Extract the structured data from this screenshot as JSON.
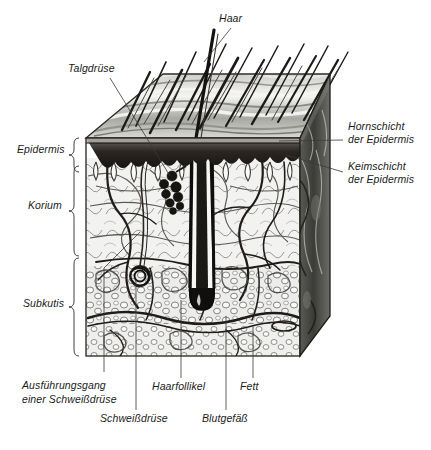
{
  "figure": {
    "type": "anatomical-cross-section",
    "language": "de",
    "style": "ink-drawing-halftone",
    "background_color": "#ffffff",
    "ink_color": "#1a1a1a",
    "leader_line_color": "#3a3a3a"
  },
  "labels": {
    "haar": "Haar",
    "talgdruese": "Talgdrüse",
    "epidermis": "Epidermis",
    "korium": "Korium",
    "subkutis": "Subkutis",
    "hornschicht_l1": "Hornschicht",
    "hornschicht_l2": "der Epidermis",
    "keimschicht_l1": "Keimschicht",
    "keimschicht_l2": "der Epidermis",
    "ausfuehrungsgang_l1": "Ausführungsgang",
    "ausfuehrungsgang_l2": "einer Schweißdrüse",
    "haarfollikel": "Haarfollikel",
    "fett": "Fett",
    "schweissdruese": "Schweißdrüse",
    "blutgefaess": "Blutgefäß"
  },
  "layer_braces": [
    {
      "name": "Epidermis",
      "top": 138,
      "bottom": 164
    },
    {
      "name": "Korium",
      "top": 166,
      "bottom": 256
    },
    {
      "name": "Subkutis",
      "top": 258,
      "bottom": 356
    }
  ]
}
